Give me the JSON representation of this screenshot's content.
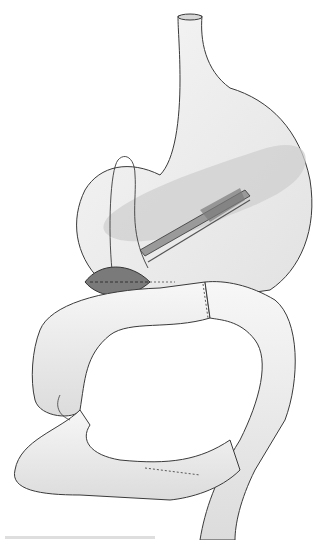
{
  "figure": {
    "colors": {
      "background": "#ffffff",
      "organ_fill": "#eeeeee",
      "organ_shade": "#d4d4d4",
      "pancreas_fill": "#c8c8c8",
      "outline": "#3a3a3a",
      "incision_dark": "#6a6a6a",
      "instrument": "#8a8a8a"
    }
  }
}
